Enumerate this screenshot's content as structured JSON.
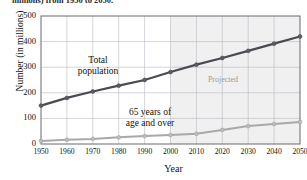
{
  "figure": {
    "caption_fragment": "millions) from 1950 to 2050.",
    "annotations": {
      "total_population_line1": "Total",
      "total_population_line2": "population",
      "elderly_line1": "65 years of",
      "elderly_line2": "age and over",
      "projected": "Projected"
    }
  },
  "colors": {
    "total_population": "#4a4a52",
    "elderly": "#a8a8a8",
    "grid": "#b9b9c2",
    "axis": "#6a6a72",
    "projected_band": "#f0f0f0",
    "projected_text": "#9a9a9a",
    "background": "#ffffff"
  },
  "chart_data": {
    "type": "line",
    "title": "",
    "xlabel": "Year",
    "ylabel": "Number (in millions)",
    "xlim": [
      1950,
      2050
    ],
    "ylim": [
      0,
      500
    ],
    "yticks": [
      0,
      100,
      200,
      300,
      400,
      500
    ],
    "xticks": [
      1950,
      1960,
      1970,
      1980,
      1990,
      2000,
      2010,
      2020,
      2030,
      2040,
      2050
    ],
    "grid": true,
    "legend": "inline-annotations",
    "projection_starts": 2000,
    "x": [
      1950,
      1960,
      1970,
      1980,
      1990,
      2000,
      2010,
      2020,
      2030,
      2040,
      2050
    ],
    "series": [
      {
        "name": "Total population",
        "color": "#4a4a52",
        "values": [
          150,
          180,
          205,
          228,
          250,
          281,
          310,
          336,
          364,
          392,
          420
        ]
      },
      {
        "name": "65 years of age and over",
        "color": "#a8a8a8",
        "values": [
          12,
          17,
          20,
          26,
          31,
          35,
          40,
          55,
          70,
          78,
          86
        ]
      }
    ]
  }
}
